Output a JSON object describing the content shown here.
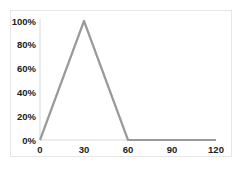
{
  "chart_data": {
    "type": "line",
    "title": "",
    "xlabel": "",
    "ylabel": "",
    "x": [
      0,
      30,
      60,
      90,
      120
    ],
    "series": [
      {
        "name": "Series 1",
        "values": [
          0,
          1.0,
          0,
          0,
          0
        ],
        "color": "#9a9a9a"
      }
    ],
    "xlim": [
      0,
      120
    ],
    "ylim": [
      0,
      1.0
    ],
    "x_ticks": [
      0,
      30,
      60,
      90,
      120
    ],
    "x_tick_labels": [
      "0",
      "30",
      "60",
      "90",
      "120"
    ],
    "y_ticks": [
      0,
      0.2,
      0.4,
      0.6,
      0.8,
      1.0
    ],
    "y_tick_labels": [
      "0%",
      "20%",
      "40%",
      "60%",
      "80%",
      "100%"
    ],
    "grid": false,
    "legend": "none",
    "axis_color": "#d9d9d9"
  }
}
